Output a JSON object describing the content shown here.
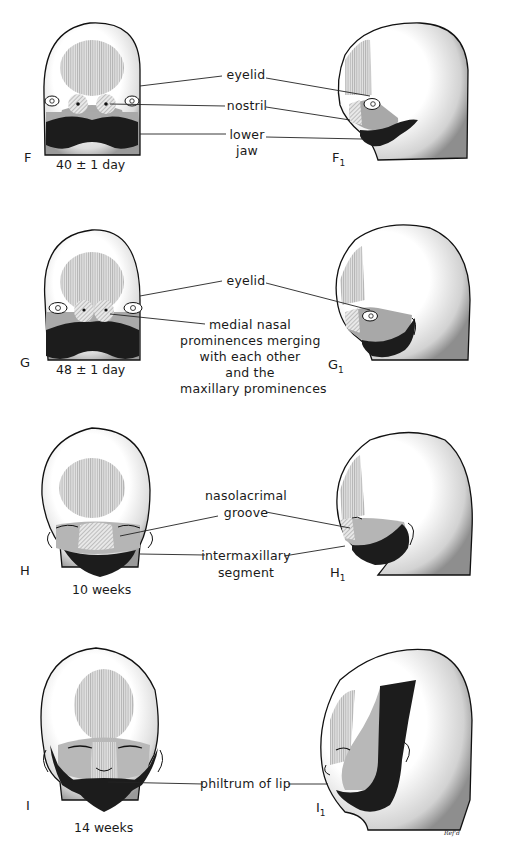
{
  "figure": {
    "colors": {
      "skin_stipple": "#ffffff",
      "frontonasal_hatch": "#c8c8c8",
      "maxillary_gray": "#a8a8a8",
      "mandibular_black": "#1c1c1c",
      "outline": "#111111",
      "leader_line": "#222222"
    },
    "panels": [
      {
        "id": "F",
        "frontal_letter": "F",
        "lateral_letter": "F",
        "lateral_subscript": "1",
        "age": "40 ± 1 day",
        "labels": [
          "eyelid",
          "nostril",
          "lower",
          "jaw"
        ]
      },
      {
        "id": "G",
        "frontal_letter": "G",
        "lateral_letter": "G",
        "lateral_subscript": "1",
        "age": "48 ± 1 day",
        "labels": [
          "eyelid",
          "medial nasal",
          "prominences merging",
          "with each other",
          "and the",
          "maxillary prominences"
        ]
      },
      {
        "id": "H",
        "frontal_letter": "H",
        "lateral_letter": "H",
        "lateral_subscript": "1",
        "age": "10 weeks",
        "labels": [
          "nasolacrimal",
          "groove",
          "intermaxillary",
          "segment"
        ]
      },
      {
        "id": "I",
        "frontal_letter": "I",
        "lateral_letter": "I",
        "lateral_subscript": "1",
        "age": "14 weeks",
        "labels": [
          "philtrum of lip"
        ]
      }
    ],
    "signature": "Ref'd"
  }
}
